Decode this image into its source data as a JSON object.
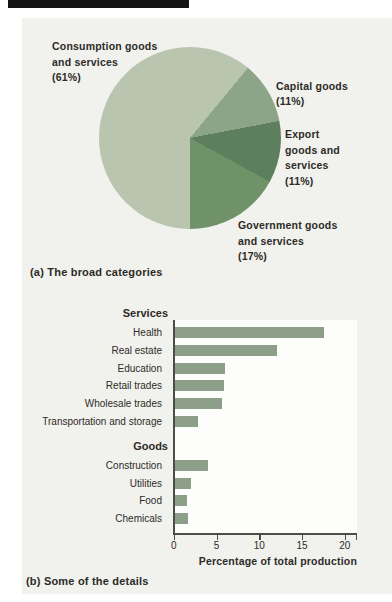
{
  "figure": {
    "caption_a": "(a) The broad categories",
    "caption_b": "(b) Some of the details"
  },
  "pie_labels": {
    "consumption": "Consumption goods\nand services\n(61%)",
    "capital": "Capital goods\n(11%)",
    "export": "Export\ngoods and\nservices\n(11%)",
    "government": "Government goods\nand services\n(17%)"
  },
  "colors": {
    "panel_bg": "#f1f1ed",
    "plot_bg": "#fdfdfc",
    "axis": "#4c4c4c",
    "text": "#2d2b28",
    "top_bar": "#141414"
  },
  "chart_data": [
    {
      "type": "pie",
      "title": "(a) The broad categories",
      "start_angle_deg": 180,
      "direction": "clockwise",
      "slices": [
        {
          "label": "Consumption goods and services",
          "value": 61,
          "color": "#b9c5af"
        },
        {
          "label": "Capital goods",
          "value": 11,
          "color": "#8ca588"
        },
        {
          "label": "Export goods and services",
          "value": 11,
          "color": "#5e7f5d"
        },
        {
          "label": "Government goods and services",
          "value": 17,
          "color": "#6f9268"
        }
      ]
    },
    {
      "type": "bar",
      "orientation": "horizontal",
      "title": "(b) Some of the details",
      "xlabel": "Percentage of total production",
      "xlim": [
        0,
        21.5
      ],
      "xticks": [
        0,
        5,
        10,
        15,
        20
      ],
      "grid": false,
      "bar_color": "#8d9f89",
      "groups": [
        {
          "header": "Services",
          "items": [
            {
              "label": "Health",
              "value": 17.5
            },
            {
              "label": "Real estate",
              "value": 12.0
            },
            {
              "label": "Education",
              "value": 5.9
            },
            {
              "label": "Retail trades",
              "value": 5.8
            },
            {
              "label": "Wholesale trades",
              "value": 5.5
            },
            {
              "label": "Transportation and storage",
              "value": 2.8
            }
          ]
        },
        {
          "header": "Goods",
          "items": [
            {
              "label": "Construction",
              "value": 3.9
            },
            {
              "label": "Utilities",
              "value": 1.9
            },
            {
              "label": "Food",
              "value": 1.5
            },
            {
              "label": "Chemicals",
              "value": 1.6
            }
          ]
        }
      ]
    }
  ]
}
